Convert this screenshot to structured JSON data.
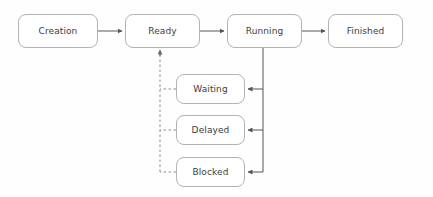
{
  "diagram": {
    "type": "state-machine",
    "canvas": {
      "width": 433,
      "height": 197,
      "background": "#fefefe"
    },
    "style": {
      "node_stroke": "#b3b3b3",
      "node_fill": "#ffffff",
      "node_radius": 8,
      "text_color": "#3c3c3c",
      "edge_solid_color": "#555555",
      "edge_dashed_color": "#8c8c8c"
    },
    "nodes": [
      {
        "id": "creation",
        "label": "Creation",
        "x": 18,
        "y": 14,
        "w": 80,
        "h": 34
      },
      {
        "id": "ready",
        "label": "Ready",
        "x": 125,
        "y": 14,
        "w": 75,
        "h": 34
      },
      {
        "id": "running",
        "label": "Running",
        "x": 227,
        "y": 14,
        "w": 75,
        "h": 34
      },
      {
        "id": "finished",
        "label": "Finished",
        "x": 328,
        "y": 14,
        "w": 75,
        "h": 34
      },
      {
        "id": "waiting",
        "label": "Waiting",
        "x": 176,
        "y": 74,
        "w": 69,
        "h": 30
      },
      {
        "id": "delayed",
        "label": "Delayed",
        "x": 176,
        "y": 115,
        "w": 69,
        "h": 30
      },
      {
        "id": "blocked",
        "label": "Blocked",
        "x": 176,
        "y": 157,
        "w": 69,
        "h": 30
      }
    ],
    "edges": [
      {
        "id": "creation-to-ready",
        "from": "creation",
        "to": "ready",
        "style": "solid",
        "arrow": true
      },
      {
        "id": "ready-to-running",
        "from": "ready",
        "to": "running",
        "style": "solid",
        "arrow": true
      },
      {
        "id": "running-to-finished",
        "from": "running",
        "to": "finished",
        "style": "solid",
        "arrow": true
      },
      {
        "id": "running-to-waiting",
        "from": "running",
        "to": "waiting",
        "style": "solid",
        "arrow": true
      },
      {
        "id": "running-to-delayed",
        "from": "running",
        "to": "delayed",
        "style": "solid",
        "arrow": true
      },
      {
        "id": "running-to-blocked",
        "from": "running",
        "to": "blocked",
        "style": "solid",
        "arrow": true
      },
      {
        "id": "waiting-to-ready",
        "from": "waiting",
        "to": "ready",
        "style": "dashed",
        "arrow": true
      },
      {
        "id": "delayed-to-ready",
        "from": "delayed",
        "to": "ready",
        "style": "dashed",
        "arrow": true
      },
      {
        "id": "blocked-to-ready",
        "from": "blocked",
        "to": "ready",
        "style": "dashed",
        "arrow": true
      }
    ]
  }
}
